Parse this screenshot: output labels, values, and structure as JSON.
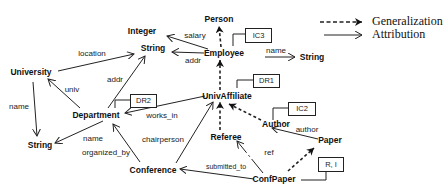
{
  "legend": {
    "generalization": "Generalization",
    "attribution": "Attribution"
  },
  "nodes": {
    "person": "Person",
    "integer": "Integer",
    "string_top": "String",
    "employee": "Employee",
    "string_right": "String",
    "university": "University",
    "univ_affiliate": "UnivAffiliate",
    "department": "Department",
    "string_left": "String",
    "author": "Author",
    "paper": "Paper",
    "referee": "Referee",
    "conference": "Conference",
    "conf_paper": "ConfPaper"
  },
  "constraint_boxes": {
    "ic3": "IC3",
    "dr1": "DR1",
    "dr2": "DR2",
    "ic2": "IC2",
    "ri": "R, I"
  },
  "edge_labels": {
    "salary": "salary",
    "addr_employee": "addr",
    "name_employee": "name",
    "location": "location",
    "addr_department": "addr",
    "univ": "univ",
    "name_university": "name",
    "works_in": "works_in",
    "name_department": "name",
    "organized_by": "organized_by",
    "chairperson": "chairperson",
    "author": "author",
    "ref": "ref",
    "submitted_to": "submitted_to"
  }
}
